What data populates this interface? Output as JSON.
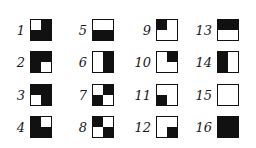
{
  "figure": {
    "colors": {
      "black": "#111111",
      "white": "#ffffff"
    },
    "squares": [
      {
        "number": "1",
        "quadrants": {
          "tl": "w",
          "tr": "b",
          "bl": "b",
          "br": "b"
        }
      },
      {
        "number": "2",
        "quadrants": {
          "tl": "b",
          "tr": "b",
          "bl": "b",
          "br": "w"
        }
      },
      {
        "number": "3",
        "quadrants": {
          "tl": "b",
          "tr": "b",
          "bl": "w",
          "br": "b"
        }
      },
      {
        "number": "4",
        "quadrants": {
          "tl": "b",
          "tr": "w",
          "bl": "b",
          "br": "b"
        }
      },
      {
        "number": "5",
        "quadrants": {
          "tl": "w",
          "tr": "w",
          "bl": "b",
          "br": "b"
        }
      },
      {
        "number": "6",
        "quadrants": {
          "tl": "w",
          "tr": "b",
          "bl": "w",
          "br": "b"
        }
      },
      {
        "number": "7",
        "quadrants": {
          "tl": "w",
          "tr": "b",
          "bl": "b",
          "br": "w"
        }
      },
      {
        "number": "8",
        "quadrants": {
          "tl": "b",
          "tr": "w",
          "bl": "w",
          "br": "b"
        }
      },
      {
        "number": "9",
        "quadrants": {
          "tl": "b",
          "tr": "w",
          "bl": "w",
          "br": "w"
        }
      },
      {
        "number": "10",
        "quadrants": {
          "tl": "w",
          "tr": "b",
          "bl": "w",
          "br": "w"
        }
      },
      {
        "number": "11",
        "quadrants": {
          "tl": "w",
          "tr": "w",
          "bl": "b",
          "br": "w"
        }
      },
      {
        "number": "12",
        "quadrants": {
          "tl": "w",
          "tr": "w",
          "bl": "w",
          "br": "b"
        }
      },
      {
        "number": "13",
        "quadrants": {
          "tl": "b",
          "tr": "b",
          "bl": "w",
          "br": "w"
        }
      },
      {
        "number": "14",
        "quadrants": {
          "tl": "b",
          "tr": "w",
          "bl": "b",
          "br": "w"
        }
      },
      {
        "number": "15",
        "quadrants": {
          "tl": "w",
          "tr": "w",
          "bl": "w",
          "br": "w"
        }
      },
      {
        "number": "16",
        "quadrants": {
          "tl": "b",
          "tr": "b",
          "bl": "b",
          "br": "b"
        }
      }
    ]
  }
}
